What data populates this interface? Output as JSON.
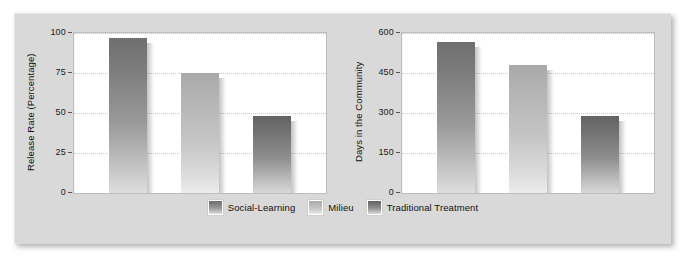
{
  "figure": {
    "background_color": "#d9d9d9",
    "legend": {
      "items": [
        {
          "label": "Social-Learning",
          "style": "g-dark"
        },
        {
          "label": "Milieu",
          "style": "g-light"
        },
        {
          "label": "Traditional Treatment",
          "style": "g-dark2"
        }
      ]
    }
  },
  "chart_data": [
    {
      "type": "bar",
      "title": "",
      "xlabel": "",
      "ylabel": "Release Rate (Percentage)",
      "categories": [
        "Social-Learning",
        "Milieu",
        "Traditional Treatment"
      ],
      "values": [
        97,
        75,
        48
      ],
      "ylim": [
        0,
        100
      ],
      "yticks": [
        "0",
        "25",
        "50",
        "75",
        "100"
      ],
      "ytick_values": [
        0,
        25,
        50,
        75,
        100
      ],
      "grid": true,
      "legend_position": "bottom-center"
    },
    {
      "type": "bar",
      "title": "",
      "xlabel": "",
      "ylabel": "Days in the Community",
      "categories": [
        "Social-Learning",
        "Milieu",
        "Traditional Treatment"
      ],
      "values": [
        565,
        480,
        290
      ],
      "ylim": [
        0,
        600
      ],
      "yticks": [
        "0",
        "150",
        "300",
        "450",
        "600"
      ],
      "ytick_values": [
        0,
        150,
        300,
        450,
        600
      ],
      "grid": true,
      "legend_position": "bottom-center"
    }
  ]
}
